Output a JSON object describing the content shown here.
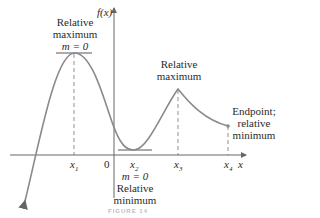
{
  "figure": {
    "caption": "FIGURE 14",
    "axes": {
      "x_label": "x",
      "y_label": "f(x)",
      "origin_label": "0"
    },
    "ticks": [
      {
        "label": "x",
        "sub": "1"
      },
      {
        "label": "x",
        "sub": "2"
      },
      {
        "label": "x",
        "sub": "3"
      },
      {
        "label": "x",
        "sub": "4"
      }
    ],
    "annotations": {
      "max1": {
        "line1": "Relative",
        "line2": "maximum",
        "slope": "m = 0"
      },
      "min1": {
        "slope": "m = 0",
        "line1": "Relative",
        "line2": "minimum"
      },
      "max2": {
        "line1": "Relative",
        "line2": "maximum"
      },
      "endpoint": {
        "line1": "Endpoint;",
        "line2": "relative",
        "line3": "minimum"
      }
    },
    "colors": {
      "curve": "#8a8a8a",
      "axis": "#555555",
      "text": "#2a2a2a"
    }
  }
}
